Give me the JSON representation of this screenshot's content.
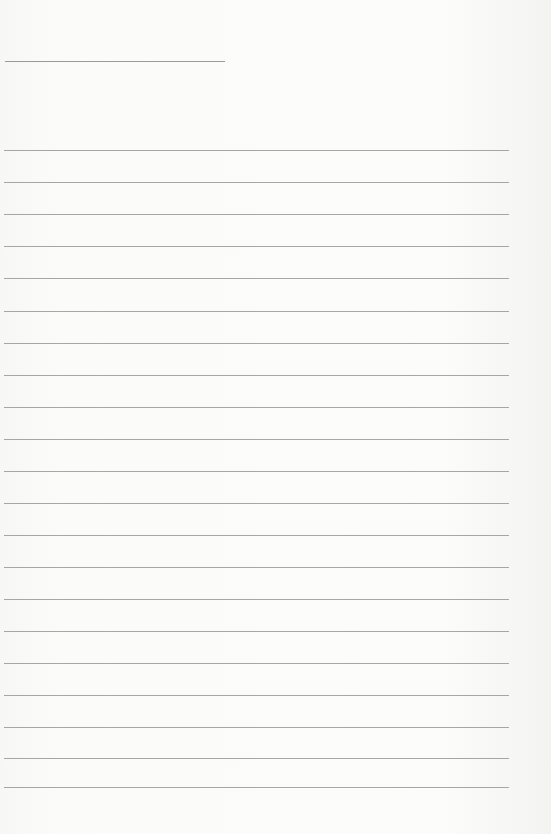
{
  "page": {
    "type": "blank lined paper",
    "header_line": {
      "x": 5,
      "y": 61,
      "width": 220
    },
    "rules": {
      "x": 4,
      "width": 505,
      "positions": [
        150,
        182,
        214,
        246,
        278,
        311,
        343,
        375,
        407,
        439,
        471,
        503,
        535,
        567,
        599,
        631,
        663,
        695,
        727,
        758,
        787
      ]
    },
    "colors": {
      "paper": "#fbfbfa",
      "line": "#a6a6a6"
    }
  }
}
